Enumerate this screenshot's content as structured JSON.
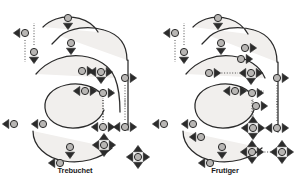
{
  "figure": {
    "background_color": "#ffffff",
    "glyph_fill_color": "#f1efed",
    "glyph_stroke_color": "#2b2b2b",
    "node_fill_color": "#b8b6b4",
    "node_stroke_color": "#2b2b2b",
    "marker_color": "#2b2b2b",
    "dotted_line_color": "#3a3a3a",
    "caption_color": "#1a1a1a"
  },
  "panels": [
    {
      "id": "left",
      "caption": "Trebuchet",
      "glyph_character": "a",
      "outline_path_outer": "M 98 32 C 90 18 70 14 56 19 C 50 21 46 24 43 27 M 127 60 C 127 44 118 34 104 30 C 88 25 70 28 60 36 M 60 36 L 52 44 M 36 74 C 48 60 66 54 82 56 C 98 58 110 66 115 78 M 115 78 C 119 88 120 100 120 112 M 128 60 L 128 130 M 33 131 C 33 146 46 158 64 161 C 82 164 100 159 112 148",
      "outline_path_inner": "M 103 96 C 96 86 80 82 66 85 C 52 88 44 97 45 108 C 46 120 58 128 73 128 C 88 128 100 121 104 110",
      "control_points": [
        {
          "name": "top-apex",
          "x": 68,
          "y": 18,
          "markers": [
            "down"
          ],
          "dotted": []
        },
        {
          "name": "terminal-upper-left",
          "x": 25,
          "y": 33,
          "markers": [
            "left"
          ],
          "dotted": [
            "down"
          ]
        },
        {
          "name": "terminal-lower-left",
          "x": 34,
          "y": 52,
          "markers": [
            "down"
          ],
          "dotted": [
            "up"
          ]
        },
        {
          "name": "inner-top-apex",
          "x": 71,
          "y": 43,
          "markers": [
            "down"
          ],
          "dotted": []
        },
        {
          "name": "bowl-top-left",
          "x": 82,
          "y": 71,
          "markers": [
            "right"
          ],
          "dotted": [
            "right"
          ]
        },
        {
          "name": "stem-upper-junction",
          "x": 101,
          "y": 72,
          "markers": [
            "left",
            "right",
            "down"
          ],
          "dotted": []
        },
        {
          "name": "stem-right-upper",
          "x": 125,
          "y": 78,
          "markers": [
            "right"
          ],
          "dotted": [
            "down"
          ]
        },
        {
          "name": "counter-top",
          "x": 85,
          "y": 91,
          "markers": [
            "left",
            "right"
          ],
          "dotted": [
            "right"
          ]
        },
        {
          "name": "counter-top-right",
          "x": 103,
          "y": 93,
          "markers": [
            "right"
          ],
          "dotted": [
            "down"
          ]
        },
        {
          "name": "left-extreme",
          "x": 14,
          "y": 124,
          "markers": [
            "left"
          ],
          "dotted": []
        },
        {
          "name": "counter-left",
          "x": 43,
          "y": 124,
          "markers": [
            "left"
          ],
          "dotted": []
        },
        {
          "name": "stem-right-lower",
          "x": 103,
          "y": 127,
          "markers": [
            "left",
            "right"
          ],
          "dotted": [
            "up"
          ]
        },
        {
          "name": "tail-right",
          "x": 125,
          "y": 127,
          "markers": [
            "left",
            "right"
          ],
          "dotted": [
            "up"
          ]
        },
        {
          "name": "counter-bottom",
          "x": 70,
          "y": 147,
          "markers": [
            "down"
          ],
          "dotted": []
        },
        {
          "name": "spur-junction",
          "x": 104,
          "y": 145,
          "markers": [
            "up",
            "down",
            "left",
            "right"
          ],
          "dotted": []
        },
        {
          "name": "bottom-extreme",
          "x": 60,
          "y": 163,
          "markers": [
            "left"
          ],
          "dotted": []
        },
        {
          "name": "tail-terminal",
          "x": 138,
          "y": 157,
          "markers": [
            "up",
            "down",
            "left",
            "right"
          ],
          "dotted": []
        }
      ]
    },
    {
      "id": "right",
      "caption": "Frutiger",
      "glyph_character": "a",
      "outline_path_outer": "M 248 34 C 240 19 220 14 206 19 C 200 21 196 24 193 27 M 277 62 C 277 45 268 34 254 30 C 238 25 220 28 210 36 M 210 36 L 202 44 M 186 74 C 198 60 216 54 232 56 C 248 58 260 66 265 78 M 278 62 L 278 132 M 183 131 C 183 146 196 158 214 161 C 232 164 250 159 262 148",
      "outline_path_inner": "M 253 96 C 246 86 230 82 216 85 C 202 88 194 97 195 108 C 196 120 208 128 223 128 C 238 128 250 121 254 110",
      "control_points": [
        {
          "name": "top-apex",
          "x": 218,
          "y": 18,
          "markers": [
            "down"
          ],
          "dotted": []
        },
        {
          "name": "terminal-upper-left",
          "x": 175,
          "y": 33,
          "markers": [
            "left"
          ],
          "dotted": [
            "down"
          ]
        },
        {
          "name": "terminal-lower-left",
          "x": 184,
          "y": 52,
          "markers": [
            "down"
          ],
          "dotted": [
            "up"
          ]
        },
        {
          "name": "inner-top-apex",
          "x": 221,
          "y": 43,
          "markers": [
            "down"
          ],
          "dotted": []
        },
        {
          "name": "shoulder-right",
          "x": 245,
          "y": 48,
          "markers": [
            "right"
          ],
          "dotted": []
        },
        {
          "name": "shoulder-curve",
          "x": 241,
          "y": 59,
          "markers": [
            "right"
          ],
          "dotted": []
        },
        {
          "name": "bowl-top-left",
          "x": 209,
          "y": 73,
          "markers": [
            "right"
          ],
          "dotted": [
            "right"
          ]
        },
        {
          "name": "stem-upper-junction",
          "x": 251,
          "y": 73,
          "markers": [
            "left",
            "right",
            "down"
          ],
          "dotted": []
        },
        {
          "name": "stem-right-upper",
          "x": 277,
          "y": 78,
          "markers": [
            "right"
          ],
          "dotted": [
            "down"
          ]
        },
        {
          "name": "counter-top",
          "x": 235,
          "y": 91,
          "markers": [
            "left",
            "right"
          ],
          "dotted": [
            "right"
          ]
        },
        {
          "name": "counter-top-right",
          "x": 252,
          "y": 93,
          "markers": [
            "right"
          ],
          "dotted": [
            "down"
          ]
        },
        {
          "name": "counter-right",
          "x": 256,
          "y": 106,
          "markers": [
            "right"
          ],
          "dotted": []
        },
        {
          "name": "left-extreme",
          "x": 164,
          "y": 124,
          "markers": [
            "left"
          ],
          "dotted": []
        },
        {
          "name": "counter-left",
          "x": 193,
          "y": 124,
          "markers": [
            "left"
          ],
          "dotted": []
        },
        {
          "name": "counter-lower-left",
          "x": 201,
          "y": 137,
          "markers": [
            "left"
          ],
          "dotted": []
        },
        {
          "name": "stem-right-lower",
          "x": 253,
          "y": 128,
          "markers": [
            "up",
            "down",
            "left",
            "right"
          ],
          "dotted": [
            "up"
          ]
        },
        {
          "name": "tail-right",
          "x": 277,
          "y": 128,
          "markers": [
            "left",
            "right"
          ],
          "dotted": [
            "up"
          ]
        },
        {
          "name": "counter-bottom",
          "x": 222,
          "y": 147,
          "markers": [
            "down"
          ],
          "dotted": []
        },
        {
          "name": "spur-junction",
          "x": 252,
          "y": 152,
          "markers": [
            "up",
            "down",
            "left",
            "right"
          ],
          "dotted": [
            "right"
          ]
        },
        {
          "name": "bottom-extreme",
          "x": 210,
          "y": 163,
          "markers": [
            "left"
          ],
          "dotted": []
        },
        {
          "name": "tail-terminal",
          "x": 282,
          "y": 152,
          "markers": [
            "up",
            "down",
            "left",
            "right"
          ],
          "dotted": []
        }
      ]
    }
  ],
  "chart_data": {
    "type": "diagram",
    "subtype": "bezier-outline-annotation",
    "items": [
      "Trebuchet",
      "Frutiger"
    ],
    "glyph": "a",
    "node_count": [
      17,
      21
    ],
    "legend": []
  }
}
